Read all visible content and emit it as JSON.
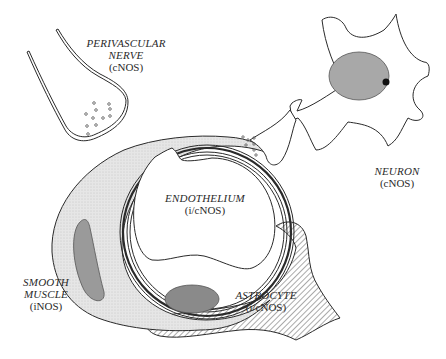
{
  "diagram": {
    "type": "schematic illustration",
    "colors": {
      "stroke": "#2a2a2a",
      "smooth_muscle_fill": "#e4e4e4",
      "smooth_muscle_nucleus": "#9a9a9a",
      "endothelial_nucleus": "#8a8a8a",
      "neuron_nucleus": "#a8a8a8",
      "nucleolus": "#111111",
      "astrocyte_hatch": "#555555",
      "background": "#ffffff"
    },
    "labels": {
      "perivascular_nerve": {
        "name_line1": "PERIVASCULAR",
        "name_line2": "NERVE",
        "enzyme": "(cNOS)"
      },
      "neuron": {
        "name": "NEURON",
        "enzyme": "(cNOS)"
      },
      "endothelium": {
        "name": "ENDOTHELIUM",
        "enzyme": "(i/cNOS)"
      },
      "smooth_muscle": {
        "name_line1": "SMOOTH",
        "name_line2": "MUSCLE",
        "enzyme": "(iNOS)"
      },
      "astrocyte": {
        "name": "ASTROCYTE",
        "enzyme": "(i/cNOS)"
      }
    }
  }
}
